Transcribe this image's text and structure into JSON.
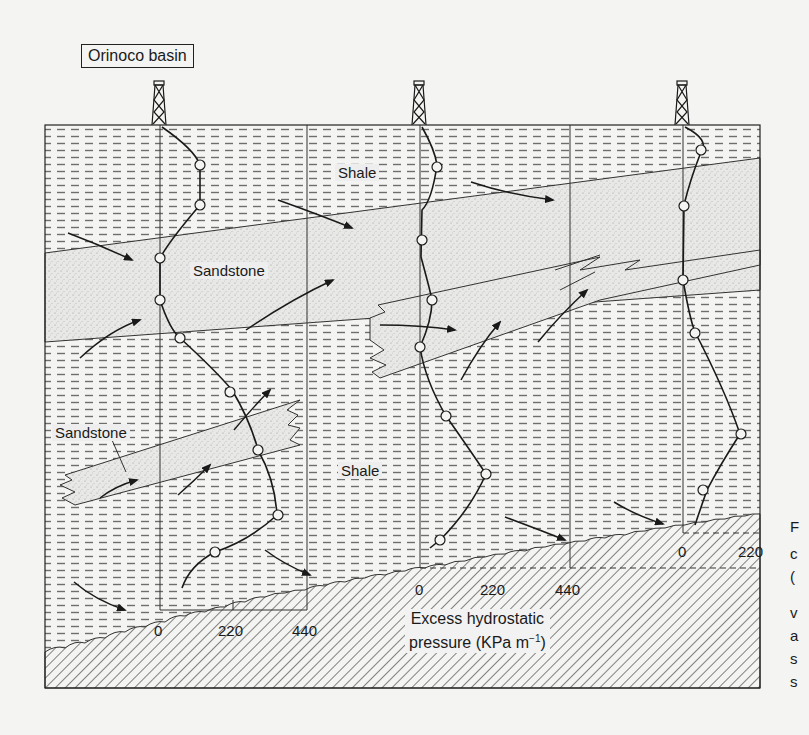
{
  "figure": {
    "title": "Orinoco basin",
    "labels": {
      "shale_top": "Shale",
      "shale_middle": "Shale",
      "sandstone_upper": "Sandstone",
      "sandstone_lower": "Sandstone"
    },
    "axis": {
      "title_line1": "Excess hydrostatic",
      "title_line2": "pressure (KPa m",
      "title_exp": "−1",
      "title_close": ")",
      "well1_ticks": [
        "0",
        "220",
        "440"
      ],
      "well2_ticks": [
        "0",
        "220",
        "440"
      ],
      "well3_ticks": [
        "0",
        "220"
      ]
    },
    "wells": [
      {
        "name": "well-1",
        "x": 160
      },
      {
        "name": "well-2",
        "x": 420
      },
      {
        "name": "well-3",
        "x": 683
      }
    ],
    "lithology": [
      "Shale",
      "Sandstone",
      "Basement (hatched)"
    ],
    "colors": {
      "line": "#1a1a1a",
      "shale_dash": "#6e6e6e",
      "sandstone": "#e4e4e4",
      "background": "#f4f4f2"
    }
  },
  "caption_edge": [
    "F",
    "c",
    "(",
    "v",
    "a",
    "s",
    "s"
  ]
}
